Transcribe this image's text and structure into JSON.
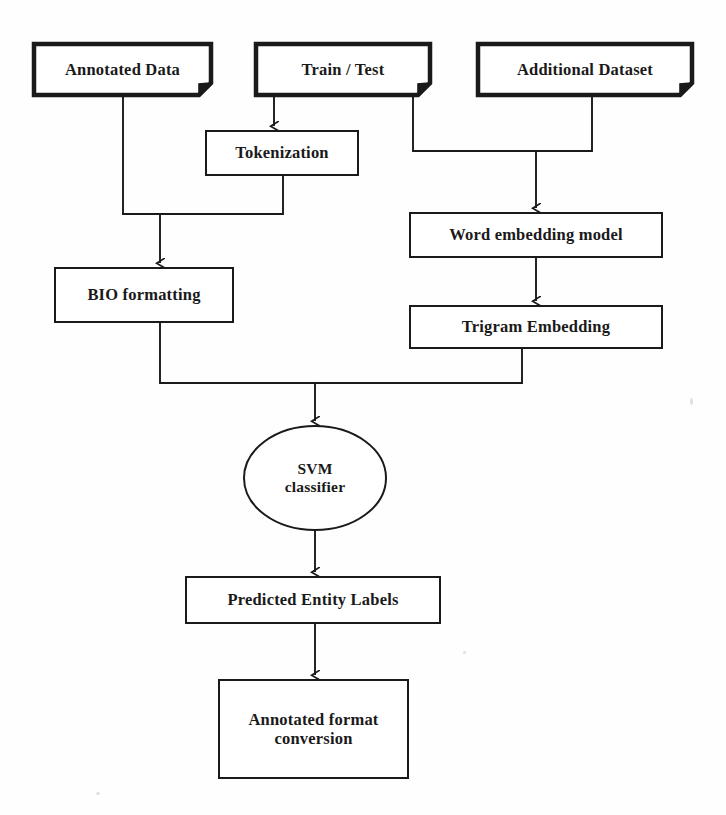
{
  "diagram": {
    "background_color": "#fefefe",
    "stroke_color": "#1a1a1a",
    "nodes": [
      {
        "id": "annotated-data",
        "label": "Annotated Data",
        "shape": "document-folded-corner",
        "x": 34,
        "y": 44,
        "w": 177,
        "h": 51,
        "stroke_width": 4.5,
        "font": "sz-16"
      },
      {
        "id": "train-test",
        "label": "Train / Test",
        "shape": "document-folded-corner",
        "x": 256,
        "y": 44,
        "w": 174,
        "h": 51,
        "stroke_width": 4.5,
        "font": "sz-16"
      },
      {
        "id": "additional-dataset",
        "label": "Additional Dataset",
        "shape": "document-folded-corner",
        "x": 478,
        "y": 44,
        "w": 214,
        "h": 51,
        "stroke_width": 4.5,
        "font": "sz-16"
      },
      {
        "id": "tokenization",
        "label": "Tokenization",
        "shape": "rect",
        "x": 206,
        "y": 131,
        "w": 152,
        "h": 44,
        "stroke_width": 2,
        "font": "sz-16"
      },
      {
        "id": "word-embedding-model",
        "label": "Word embedding model",
        "shape": "rect",
        "x": 410,
        "y": 213,
        "w": 252,
        "h": 44,
        "stroke_width": 2,
        "font": "sz-16"
      },
      {
        "id": "bio-formatting",
        "label": "BIO formatting",
        "shape": "rect",
        "x": 55,
        "y": 268,
        "w": 178,
        "h": 54,
        "stroke_width": 2,
        "font": "sz-16"
      },
      {
        "id": "trigram-embedding",
        "label": "Trigram Embedding",
        "shape": "rect",
        "x": 410,
        "y": 306,
        "w": 252,
        "h": 42,
        "stroke_width": 2,
        "font": "sz-16"
      },
      {
        "id": "svm-classifier",
        "label": "SVM\nclassifier",
        "shape": "ellipse",
        "cx": 315,
        "cy": 478,
        "rx": 71,
        "ry": 52,
        "stroke_width": 2,
        "font": "sz-15"
      },
      {
        "id": "predicted-entity-labels",
        "label": "Predicted Entity Labels",
        "shape": "rect",
        "x": 186,
        "y": 577,
        "w": 254,
        "h": 46,
        "stroke_width": 2,
        "font": "sz-16"
      },
      {
        "id": "annotated-format-conversion",
        "label": "Annotated format\nconversion",
        "shape": "rect",
        "x": 219,
        "y": 680,
        "w": 189,
        "h": 98,
        "stroke_width": 2,
        "font": "sz-16"
      }
    ],
    "edges": [
      {
        "id": "edge-annotated-data-to-merge-left",
        "from": "annotated-data",
        "to": "merge-bar-left",
        "arrow": false
      },
      {
        "id": "edge-tokenization-to-merge-left",
        "from": "tokenization",
        "to": "merge-bar-left",
        "arrow": false
      },
      {
        "id": "edge-train-test-to-tokenization",
        "from": "train-test",
        "to": "tokenization",
        "arrow": true
      },
      {
        "id": "edge-train-test-to-merge-right",
        "from": "train-test",
        "to": "merge-bar-right",
        "arrow": false
      },
      {
        "id": "edge-additional-dataset-to-merge-right",
        "from": "additional-dataset",
        "to": "merge-bar-right",
        "arrow": false
      },
      {
        "id": "edge-merge-right-to-word-embedding",
        "from": "merge-bar-right",
        "to": "word-embedding-model",
        "arrow": true
      },
      {
        "id": "edge-merge-left-to-bio-formatting",
        "from": "merge-bar-left",
        "to": "bio-formatting",
        "arrow": true
      },
      {
        "id": "edge-word-embedding-to-trigram",
        "from": "word-embedding-model",
        "to": "trigram-embedding",
        "arrow": true
      },
      {
        "id": "edge-bio-formatting-to-merge-bottom",
        "from": "bio-formatting",
        "to": "merge-bar-bottom",
        "arrow": false
      },
      {
        "id": "edge-trigram-to-merge-bottom",
        "from": "trigram-embedding",
        "to": "merge-bar-bottom",
        "arrow": false
      },
      {
        "id": "edge-merge-bottom-to-svm",
        "from": "merge-bar-bottom",
        "to": "svm-classifier",
        "arrow": true
      },
      {
        "id": "edge-svm-to-predicted-labels",
        "from": "svm-classifier",
        "to": "predicted-entity-labels",
        "arrow": true
      },
      {
        "id": "edge-predicted-labels-to-conversion",
        "from": "predicted-entity-labels",
        "to": "annotated-format-conversion",
        "arrow": true
      }
    ]
  }
}
